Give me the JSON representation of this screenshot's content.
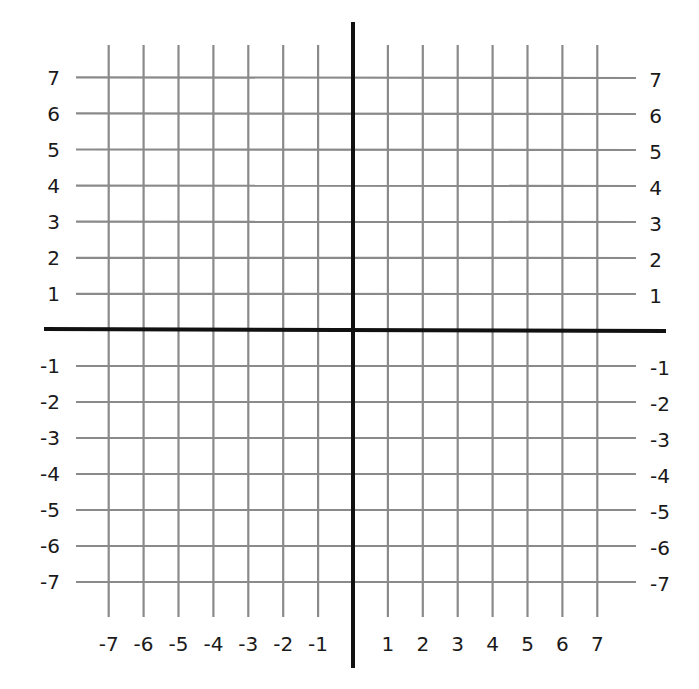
{
  "chart_data": {
    "type": "scatter",
    "title": "",
    "subtitle": "",
    "xlabel": "",
    "ylabel": "",
    "xlim": [
      -7,
      7
    ],
    "ylim": [
      -7,
      7
    ],
    "grid": true,
    "legend": null,
    "series": [],
    "x_ticks": [
      -7,
      -6,
      -5,
      -4,
      -3,
      -2,
      -1,
      1,
      2,
      3,
      4,
      5,
      6,
      7
    ],
    "y_ticks": [
      -7,
      -6,
      -5,
      -4,
      -3,
      -2,
      -1,
      1,
      2,
      3,
      4,
      5,
      6,
      7
    ],
    "x_tick_labels": [
      "-7",
      "-6",
      "-5",
      "-4",
      "-3",
      "-2",
      "-1",
      "1",
      "2",
      "3",
      "4",
      "5",
      "6",
      "7"
    ],
    "y_tick_labels": [
      "-7",
      "-6",
      "-5",
      "-4",
      "-3",
      "-2",
      "-1",
      "1",
      "2",
      "3",
      "4",
      "5",
      "6",
      "7"
    ],
    "y_labels_on_both_sides": true
  },
  "style": {
    "grid_color": "#8a8a8a",
    "axis_color": "#111111",
    "background": "#ffffff"
  }
}
